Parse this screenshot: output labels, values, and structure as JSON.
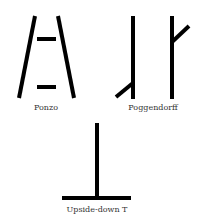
{
  "illusions": [
    {
      "name": "ponzo",
      "label": "Ponzo"
    },
    {
      "name": "poggendorff",
      "label": "Poggendorff"
    },
    {
      "name": "upside-down-t",
      "label": "Upside-down T"
    }
  ],
  "colors": {
    "stroke": "#000000",
    "label": "#333333",
    "background": "#ffffff"
  }
}
